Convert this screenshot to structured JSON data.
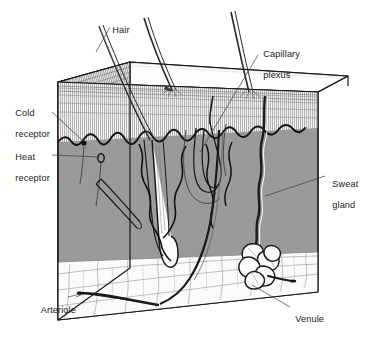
{
  "figure": {
    "type": "anatomical-block-diagram",
    "background_color": "#ffffff",
    "ink_color": "#1a1a1a"
  },
  "colors": {
    "dermis_front": "#9a9a9a",
    "dermis_left": "#8e8e8e",
    "epidermis": "#f2f2f2",
    "hypodermis": "#fbfbfb",
    "top_surface": "#fdfdfd",
    "outline": "#1a1a1a",
    "leader_line": "#3a3a3a"
  },
  "labels": [
    {
      "id": "hair",
      "text": "Hair",
      "line1": "Hair",
      "line2": "",
      "x": 107,
      "y": 14
    },
    {
      "id": "capillary-plexus",
      "text": "Capillary plexus",
      "line1": "Capillary",
      "line2": "plexus",
      "x": 258,
      "y": 38
    },
    {
      "id": "cold-receptor",
      "text": "Cold receptor",
      "line1": "Cold",
      "line2": "receptor",
      "x": 10,
      "y": 97
    },
    {
      "id": "heat-receptor",
      "text": "Heat receptor",
      "line1": "Heat",
      "line2": "receptor",
      "x": 10,
      "y": 141
    },
    {
      "id": "sweat-gland",
      "text": "Sweat gland",
      "line1": "Sweat",
      "line2": "gland",
      "x": 327,
      "y": 168
    },
    {
      "id": "arteriole",
      "text": "Arteriole",
      "line1": "Arteriole",
      "line2": "",
      "x": 36,
      "y": 294
    },
    {
      "id": "venule",
      "text": "Venule",
      "line1": "Venule",
      "line2": "",
      "x": 290,
      "y": 303
    }
  ],
  "structures": [
    {
      "id": "epidermis",
      "name": "Epidermis layer with vertical striations"
    },
    {
      "id": "dermis",
      "name": "Dermis, shaded gray"
    },
    {
      "id": "hypodermis",
      "name": "Subcutaneous fat layer, reticular cell network"
    },
    {
      "id": "hair-shaft-1",
      "name": "Hair shaft left"
    },
    {
      "id": "hair-shaft-2",
      "name": "Hair shaft middle"
    },
    {
      "id": "hair-shaft-3",
      "name": "Hair shaft right"
    },
    {
      "id": "hair-follicle",
      "name": "Hair follicle with bulb"
    },
    {
      "id": "sweat-gland-coil",
      "name": "Coiled sweat gland"
    },
    {
      "id": "sweat-duct",
      "name": "Sweat duct spiralling to surface"
    },
    {
      "id": "capillary-loops",
      "name": "Capillary plexus loops below epidermis"
    },
    {
      "id": "arteriole-vessel",
      "name": "Arteriole in subcutaneous layer"
    },
    {
      "id": "venule-vessel",
      "name": "Venule in subcutaneous layer"
    },
    {
      "id": "nerve-cold",
      "name": "Cold receptor nerve ending"
    },
    {
      "id": "nerve-heat",
      "name": "Heat receptor nerve ending"
    },
    {
      "id": "nerve-plexus",
      "name": "Branching nerve plexus on left face"
    }
  ]
}
